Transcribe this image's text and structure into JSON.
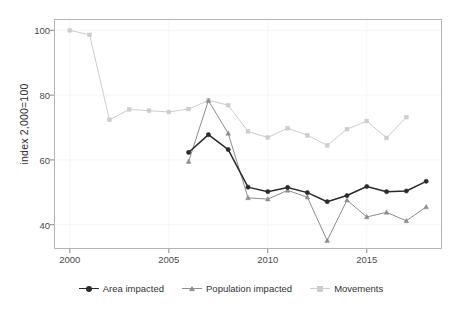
{
  "chart_data": {
    "type": "line",
    "title": "",
    "subtitle": "",
    "xlabel": "",
    "ylabel": "index 2,000=100",
    "xlim": [
      1999.2,
      2018.8
    ],
    "ylim": [
      32.5,
      103.5
    ],
    "xticks": [
      2000,
      2005,
      2010,
      2015
    ],
    "yticks": [
      40,
      60,
      80,
      100
    ],
    "grid": true,
    "legend_position": "bottom",
    "series": [
      {
        "name": "Area impacted",
        "color": "#2b2b2b",
        "marker": "circle",
        "x": [
          2006,
          2007,
          2008,
          2009,
          2010,
          2011,
          2012,
          2013,
          2014,
          2015,
          2016,
          2017,
          2018
        ],
        "values": [
          62.3,
          67.8,
          63.2,
          51.6,
          50.2,
          51.5,
          49.9,
          47.1,
          49.0,
          51.8,
          50.2,
          50.4,
          53.4
        ]
      },
      {
        "name": "Population impacted",
        "color": "#8d8d8d",
        "marker": "triangle",
        "x": [
          2006,
          2007,
          2008,
          2009,
          2010,
          2011,
          2012,
          2013,
          2014,
          2015,
          2016,
          2017,
          2018
        ],
        "values": [
          59.5,
          78.3,
          68.2,
          48.3,
          47.9,
          50.6,
          48.5,
          35.1,
          47.6,
          42.4,
          43.8,
          41.2,
          45.5
        ]
      },
      {
        "name": "Movements",
        "color": "#cdcdcd",
        "marker": "square",
        "x": [
          2000,
          2001,
          2002,
          2003,
          2004,
          2005,
          2006,
          2007,
          2008,
          2009,
          2010,
          2011,
          2012,
          2013,
          2014,
          2015,
          2016,
          2017
        ],
        "values": [
          100.0,
          98.6,
          72.4,
          75.6,
          75.2,
          74.8,
          75.7,
          78.4,
          76.9,
          68.8,
          66.9,
          69.8,
          67.6,
          64.5,
          69.5,
          72.0,
          66.8,
          73.2
        ]
      }
    ]
  },
  "axes": {
    "y_title": "index 2,000=100",
    "y_tick_labels": [
      "100",
      "80",
      "60",
      "40"
    ],
    "x_tick_labels": [
      "2000",
      "2005",
      "2010",
      "2015"
    ]
  },
  "legend": {
    "items": [
      {
        "label": "Area impacted",
        "marker": "circle-marker",
        "color": "#2b2b2b"
      },
      {
        "label": "Population impacted",
        "marker": "triangle-marker",
        "color": "#8d8d8d"
      },
      {
        "label": "Movements",
        "marker": "square-marker",
        "color": "#cdcdcd"
      }
    ]
  },
  "plot_frame": {
    "left": 54,
    "top": 19,
    "right": 442,
    "bottom": 249,
    "border_color": "#b4b4b4"
  }
}
